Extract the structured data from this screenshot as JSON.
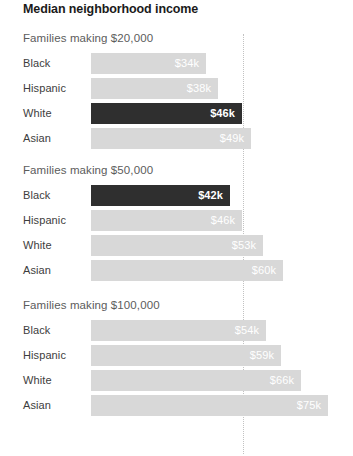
{
  "chart": {
    "title": "Median neighborhood income",
    "gridline_x_px": 243,
    "bar_origin_px": 91,
    "px_per_k": 2.98
  },
  "chart_data": {
    "type": "bar",
    "title": "Median neighborhood income",
    "xlabel": "",
    "ylabel": "",
    "orientation": "horizontal",
    "grid": "single dotted vertical reference line",
    "legend": "none",
    "value_unit": "thousands of dollars (median neighborhood income)",
    "categories": [
      "Black",
      "Hispanic",
      "White",
      "Asian"
    ],
    "groups": [
      {
        "label": "Families making $20,000",
        "bars": [
          {
            "category": "Black",
            "value": 34,
            "value_label": "$34k",
            "highlight": false
          },
          {
            "category": "Hispanic",
            "value": 38,
            "value_label": "$38k",
            "highlight": false
          },
          {
            "category": "White",
            "value": 46,
            "value_label": "$46k",
            "highlight": true
          },
          {
            "category": "Asian",
            "value": 49,
            "value_label": "$49k",
            "highlight": false
          }
        ]
      },
      {
        "label": "Families making $50,000",
        "bars": [
          {
            "category": "Black",
            "value": 42,
            "value_label": "$42k",
            "highlight": true
          },
          {
            "category": "Hispanic",
            "value": 46,
            "value_label": "$46k",
            "highlight": false
          },
          {
            "category": "White",
            "value": 53,
            "value_label": "$53k",
            "highlight": false
          },
          {
            "category": "Asian",
            "value": 60,
            "value_label": "$60k",
            "highlight": false
          }
        ]
      },
      {
        "label": "Families making $100,000",
        "bars": [
          {
            "category": "Black",
            "value": 54,
            "value_label": "$54k",
            "highlight": false
          },
          {
            "category": "Hispanic",
            "value": 59,
            "value_label": "$59k",
            "highlight": false
          },
          {
            "category": "White",
            "value": 66,
            "value_label": "$66k",
            "highlight": false
          },
          {
            "category": "Asian",
            "value": 75,
            "value_label": "$75k",
            "highlight": false
          }
        ]
      }
    ],
    "colors": {
      "bar_default": "#d8d8d8",
      "bar_highlight": "#2f2f2f",
      "value_text": "#ffffff",
      "title_text": "#1a1a1a",
      "group_label_text": "#5c5c5c",
      "category_label_text": "#3d3d3d",
      "gridline": "#c2c2c2",
      "background": "#ffffff"
    }
  }
}
